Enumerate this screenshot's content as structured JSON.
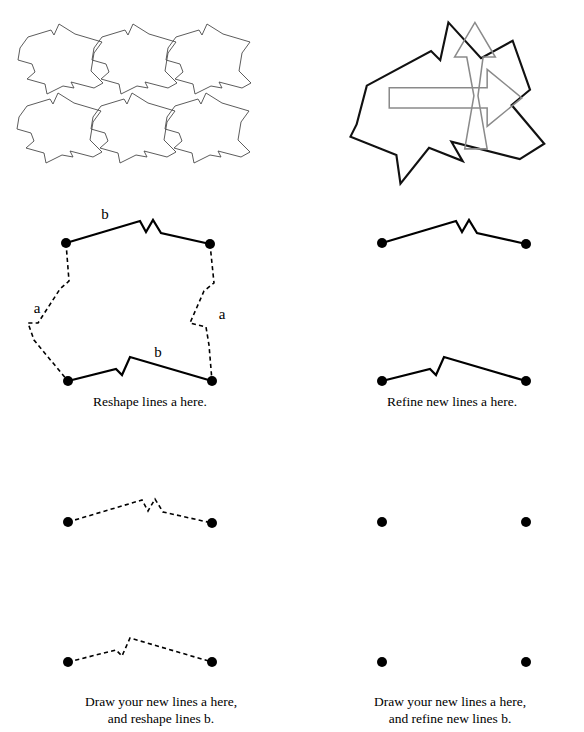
{
  "page": {
    "width": 584,
    "height": 732,
    "background": "#ffffff",
    "ink": "#000000",
    "tessellation_stroke": "#4a4a4a",
    "arrow_stroke": "#8a8a8a",
    "outline_stroke": "#111111"
  },
  "panels": [
    {
      "id": "tessellation",
      "name": "tessellation-grid",
      "kind": "tiling",
      "description": "Six interlocking irregular tiles arranged in a 3 by 2 translational tessellation.",
      "rows": 2,
      "columns": 3,
      "tile_offset_x": 72,
      "tile_offset_y": 72,
      "caption": ""
    },
    {
      "id": "single-tile",
      "name": "single-tile-with-arrows",
      "kind": "outline",
      "description": "A single tile outline with a vertical up arrow and a horizontal right arrow showing the two translation directions.",
      "arrows": [
        "up-arrow",
        "right-arrow"
      ],
      "caption": ""
    },
    {
      "id": "reshape-a",
      "name": "reshape-lines-a-panel",
      "kind": "worked-example",
      "caption": "Reshape lines a here.",
      "labels": [
        {
          "text": "b",
          "position": "top"
        },
        {
          "text": "a",
          "position": "left"
        },
        {
          "text": "a",
          "position": "right"
        },
        {
          "text": "b",
          "position": "bottom"
        }
      ],
      "solid_edges": [
        "top-b",
        "bottom-b"
      ],
      "dashed_edges": [
        "left-a",
        "right-a"
      ],
      "vertex_count": 4
    },
    {
      "id": "refine-a",
      "name": "refine-new-lines-a-panel",
      "kind": "worked-example",
      "caption": "Refine new lines a here.",
      "solid_edges": [
        "top-b",
        "bottom-b"
      ],
      "dashed_edges": [],
      "vertex_count": 4
    },
    {
      "id": "draw-reshape",
      "name": "draw-and-reshape-panel",
      "kind": "practice",
      "caption": "Draw your new lines a here,\nand reshape lines b.",
      "solid_edges": [],
      "dashed_edges": [
        "top-b",
        "bottom-b"
      ],
      "vertex_count": 4
    },
    {
      "id": "draw-refine",
      "name": "draw-and-refine-panel",
      "kind": "practice",
      "caption": "Draw your new lines a here,\nand refine new lines b.",
      "solid_edges": [],
      "dashed_edges": [],
      "vertex_count": 4
    }
  ],
  "geometry": {
    "tile_outline": "M 16,40 L 24,29 L 47,22 L 50,27 L 55,16 L 71,26 L 98,34 L 90,45 L 87,63 L 99,75 L 90,80 L 67,74 L 70,80 L 59,78 L 43,86 L 41,76 L 23,71 L 31,64 L 28,56 L 14,52 Z",
    "tile_points": [
      [
        16,
        40
      ],
      [
        24,
        29
      ],
      [
        47,
        22
      ],
      [
        50,
        27
      ],
      [
        55,
        16
      ],
      [
        71,
        26
      ],
      [
        98,
        34
      ],
      [
        90,
        45
      ],
      [
        87,
        63
      ],
      [
        99,
        75
      ],
      [
        90,
        80
      ],
      [
        67,
        74
      ],
      [
        70,
        80
      ],
      [
        59,
        78
      ],
      [
        43,
        86
      ],
      [
        41,
        76
      ],
      [
        23,
        71
      ],
      [
        31,
        64
      ],
      [
        28,
        56
      ],
      [
        14,
        52
      ]
    ],
    "outline_big": "M 30,120 L 40,82 L 103,48 L 112,57 L 120,20 L 152,55 L 183,38 L 200,86 L 182,101 L 214,139 L 190,154 L 123,137 L 134,156 L 101,143 L 73,178 L 69,150 L 24,132 Z",
    "up_arrow": "M 140,42 L 160,8 L 180,42 L 168,42 L 163,86 L 172,131 L 150,131 L 158,86 L 153,42 Z",
    "right_arrow": "M 42,80 L 140,80 L 140,62 L 176,90 L 140,118 L 140,100 L 42,100 Z",
    "polyline_b_top": "M 10,24 L 84,4 L 90,13 L 96,3 L 102,13 L 146,22",
    "polyline_b_bottom": "M 10,30 L 56,18 L 62,24 L 70,8 L 146,26",
    "polyline_a_left": "M 0,0 L 3,34 L -6,42 L -26,72 L -36,72 L -31,90 L -18,106",
    "polyline_a_right": "M 0,0 L 4,38 L -6,46 L -20,76 L -4,80 L -1,98 L 2,114"
  },
  "colors": {
    "ink": "#000000",
    "tile_line": "#4a4a4a",
    "arrow_line": "#8a8a8a",
    "outline_line": "#111111",
    "paper": "#ffffff"
  }
}
